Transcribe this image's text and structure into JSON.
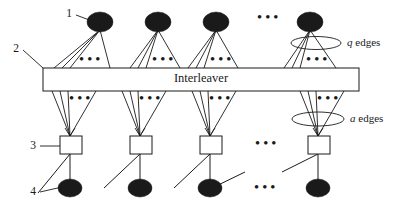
{
  "figure": {
    "title_text": "Interleaver",
    "background_color": "#ffffff",
    "ink_color": "#1a1a1a",
    "width": 406,
    "height": 209
  },
  "interleaver": {
    "label": "Interleaver",
    "x": 43,
    "y": 68,
    "width": 316,
    "height": 23,
    "label_cx": 201,
    "label_cy": 79.5
  },
  "callouts": [
    {
      "id": "callout-1",
      "label": "1",
      "text_x": 69,
      "text_y": 14,
      "line_x1": 76,
      "line_y1": 15,
      "line_x2": 92,
      "line_y2": 21,
      "target": "top-variable-node"
    },
    {
      "id": "callout-2",
      "label": "2",
      "text_x": 16,
      "text_y": 49,
      "line_x1": 23,
      "line_y1": 50,
      "line_x2": 43,
      "line_y2": 68,
      "target": "interleaver-box"
    },
    {
      "id": "callout-3",
      "label": "3",
      "text_x": 33,
      "text_y": 146,
      "line_x1": 40,
      "line_y1": 146,
      "line_x2": 60,
      "line_y2": 146,
      "target": "check-node-square"
    },
    {
      "id": "callout-4",
      "label": "4",
      "text_x": 33,
      "text_y": 192,
      "line_x1": 40,
      "line_y1": 192,
      "line_x2": 62,
      "line_y2": 187,
      "target": "bottom-variable-node"
    }
  ],
  "annotations": [
    {
      "id": "q-edges",
      "var": "q",
      "suffix": " edges",
      "text_x": 347,
      "text_y": 43,
      "ellipse_cx": 316,
      "ellipse_cy": 43,
      "ellipse_rx": 25,
      "ellipse_ry": 6.5
    },
    {
      "id": "a-edges",
      "var": "a",
      "suffix": " edges",
      "text_x": 350,
      "text_y": 119,
      "ellipse_cx": 318,
      "ellipse_cy": 119,
      "ellipse_rx": 26,
      "ellipse_ry": 7
    }
  ],
  "top_nodes": [
    {
      "id": "top-node-1",
      "cx": 100,
      "cy": 22,
      "rx": 13,
      "ry": 10
    },
    {
      "id": "top-node-2",
      "cx": 158,
      "cy": 22,
      "rx": 13,
      "ry": 10
    },
    {
      "id": "top-node-3",
      "cx": 216,
      "cy": 22,
      "rx": 13,
      "ry": 10
    },
    {
      "id": "top-node-4",
      "cx": 310,
      "cy": 22,
      "rx": 13,
      "ry": 10
    }
  ],
  "top_fan_edges": [
    {
      "node_cx": 100,
      "node_cy": 30,
      "targets": [
        54,
        62,
        70,
        110
      ]
    },
    {
      "node_cx": 158,
      "node_cy": 30,
      "targets": [
        130,
        138,
        146,
        180
      ]
    },
    {
      "node_cx": 216,
      "node_cy": 30,
      "targets": [
        188,
        196,
        204,
        238
      ]
    },
    {
      "node_cx": 310,
      "node_cy": 30,
      "targets": [
        284,
        292,
        300,
        336
      ]
    }
  ],
  "top_gap_dots": [
    {
      "id": "top-fan-dots-1",
      "x": 90,
      "y": 60
    },
    {
      "id": "top-fan-dots-2",
      "x": 163,
      "y": 60
    },
    {
      "id": "top-fan-dots-3",
      "x": 221,
      "y": 60
    },
    {
      "id": "top-fan-dots-4",
      "x": 317,
      "y": 60
    }
  ],
  "top_row_dots": [
    {
      "id": "top-row-dots",
      "x": 268,
      "y": 18
    }
  ],
  "bottom_fan_edges": [
    {
      "node_cx": 70,
      "node_cy": 136,
      "sources": [
        52,
        60,
        68,
        96
      ]
    },
    {
      "node_cx": 140,
      "node_cy": 136,
      "sources": [
        122,
        130,
        138,
        166
      ]
    },
    {
      "node_cx": 210,
      "node_cy": 136,
      "sources": [
        192,
        200,
        208,
        236
      ]
    },
    {
      "node_cx": 318,
      "node_cy": 136,
      "sources": [
        300,
        308,
        316,
        344
      ]
    }
  ],
  "bottom_gap_dots": [
    {
      "id": "bottom-fan-dots-1",
      "x": 80,
      "y": 99
    },
    {
      "id": "bottom-fan-dots-2",
      "x": 150,
      "y": 99
    },
    {
      "id": "bottom-fan-dots-3",
      "x": 220,
      "y": 99
    },
    {
      "id": "bottom-fan-dots-4",
      "x": 328,
      "y": 99
    }
  ],
  "check_nodes": [
    {
      "id": "check-node-1",
      "x": 60,
      "y": 136,
      "width": 22,
      "height": 18
    },
    {
      "id": "check-node-2",
      "x": 130,
      "y": 136,
      "width": 22,
      "height": 18
    },
    {
      "id": "check-node-3",
      "x": 200,
      "y": 136,
      "width": 22,
      "height": 18
    },
    {
      "id": "check-node-4",
      "x": 308,
      "y": 136,
      "width": 22,
      "height": 18
    }
  ],
  "check_row_dots": [
    {
      "id": "check-row-dots",
      "x": 266,
      "y": 144
    }
  ],
  "bottom_nodes": [
    {
      "id": "bottom-node-1",
      "cx": 70,
      "cy": 188,
      "rx": 12,
      "ry": 9
    },
    {
      "id": "bottom-node-2",
      "cx": 140,
      "cy": 188,
      "rx": 12,
      "ry": 9
    },
    {
      "id": "bottom-node-3",
      "cx": 210,
      "cy": 188,
      "rx": 12,
      "ry": 9
    },
    {
      "id": "bottom-node-4",
      "cx": 318,
      "cy": 188,
      "rx": 12,
      "ry": 9
    }
  ],
  "bottom_row_dots": [
    {
      "id": "bottom-row-dots",
      "x": 265,
      "y": 188
    }
  ],
  "vertical_links": [
    {
      "id": "vlink-1",
      "x": 70,
      "y1": 154,
      "y2": 188
    },
    {
      "id": "vlink-2",
      "x": 140,
      "y1": 154,
      "y2": 188
    },
    {
      "id": "vlink-3",
      "x": 210,
      "y1": 154,
      "y2": 188
    },
    {
      "id": "vlink-4",
      "x": 318,
      "y1": 154,
      "y2": 188
    }
  ],
  "diagonal_links": [
    {
      "id": "dlink-1",
      "x1": 70,
      "y1": 154,
      "x2": 38,
      "y2": 193
    },
    {
      "id": "dlink-2",
      "x1": 140,
      "y1": 154,
      "x2": 104,
      "y2": 188
    },
    {
      "id": "dlink-3",
      "x1": 210,
      "y1": 154,
      "x2": 174,
      "y2": 188
    },
    {
      "id": "dlink-4",
      "x1": 318,
      "y1": 154,
      "x2": 282,
      "y2": 172
    },
    {
      "id": "dlink-5",
      "x1": 245,
      "y1": 172,
      "x2": 212,
      "y2": 188
    }
  ],
  "legend": {
    "node_1_meaning": "variable-node-top",
    "node_2_meaning": "interleaver",
    "node_3_meaning": "check-node",
    "node_4_meaning": "variable-node-bottom"
  }
}
